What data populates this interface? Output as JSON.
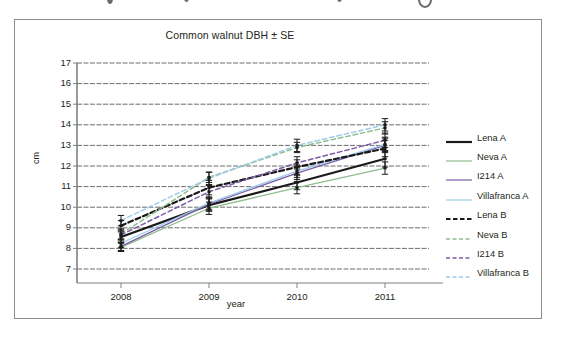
{
  "figure": {
    "title": "Common  walnut DBH ± SE",
    "border_color": "#8d8d8d",
    "background": "#ffffff"
  },
  "axes": {
    "x_title": "year",
    "y_title": "cm",
    "x_ticks": [
      "2008",
      "2009",
      "2010",
      "2011"
    ],
    "y_ticks": [
      "17",
      "16",
      "15",
      "14",
      "13",
      "12",
      "11",
      "10",
      "9",
      "8",
      "7"
    ],
    "gridline_color": "#555555",
    "axis_color": "#808080"
  },
  "legend": {
    "items": [
      {
        "label": "Lena A",
        "color": "#1a1a1a",
        "style": "solid",
        "width": 2.2
      },
      {
        "label": "Neva A",
        "color": "#8fbc8f",
        "style": "solid",
        "width": 1.2
      },
      {
        "label": "I214 A",
        "color": "#7b5ea7",
        "style": "solid",
        "width": 1.2
      },
      {
        "label": "Villafranca A",
        "color": "#9ecbe8",
        "style": "solid",
        "width": 1.2
      },
      {
        "label": "Lena B",
        "color": "#1a1a1a",
        "style": "dashed",
        "width": 2.2
      },
      {
        "label": "Neva B",
        "color": "#8fbc8f",
        "style": "dashed",
        "width": 1.4
      },
      {
        "label": "I214 B",
        "color": "#7b5ea7",
        "style": "dashed",
        "width": 1.4
      },
      {
        "label": "Villafranca B",
        "color": "#9ecbe8",
        "style": "dashed",
        "width": 1.4
      }
    ]
  },
  "chart_data": {
    "type": "line",
    "title": "Common  walnut DBH ± SE",
    "xlabel": "year",
    "ylabel": "cm",
    "x": [
      "2008",
      "2009",
      "2010",
      "2011"
    ],
    "ylim": [
      7,
      17
    ],
    "ytick_step": 1,
    "grid": true,
    "legend_position": "right",
    "error_bars": "SE",
    "series": [
      {
        "name": "Lena A",
        "color": "#1a1a1a",
        "style": "solid",
        "values": [
          8.55,
          10.1,
          11.2,
          12.35
        ],
        "errors": [
          0.25,
          0.3,
          0.35,
          0.4
        ]
      },
      {
        "name": "Neva A",
        "color": "#8fbc8f",
        "style": "solid",
        "values": [
          8.05,
          9.95,
          10.95,
          11.9
        ],
        "errors": [
          0.2,
          0.3,
          0.3,
          0.3
        ]
      },
      {
        "name": "I214 A",
        "color": "#7b5ea7",
        "style": "solid",
        "values": [
          8.1,
          10.15,
          11.65,
          13.0
        ],
        "errors": [
          0.2,
          0.3,
          0.3,
          0.35
        ]
      },
      {
        "name": "Villafranca A",
        "color": "#9ecbe8",
        "style": "solid",
        "values": [
          8.25,
          10.2,
          11.75,
          13.05
        ],
        "errors": [
          0.2,
          0.3,
          0.3,
          0.35
        ]
      },
      {
        "name": "Lena B",
        "color": "#1a1a1a",
        "style": "dashed",
        "values": [
          9.1,
          10.95,
          11.95,
          12.85
        ],
        "errors": [
          0.25,
          0.35,
          0.35,
          0.4
        ]
      },
      {
        "name": "Neva B",
        "color": "#8fbc8f",
        "style": "dashed",
        "values": [
          8.7,
          11.45,
          12.9,
          13.85
        ],
        "errors": [
          0.25,
          0.25,
          0.25,
          0.3
        ]
      },
      {
        "name": "I214 B",
        "color": "#7b5ea7",
        "style": "dashed",
        "values": [
          8.65,
          10.75,
          12.15,
          13.25
        ],
        "errors": [
          0.25,
          0.3,
          0.3,
          0.35
        ]
      },
      {
        "name": "Villafranca B",
        "color": "#9ecbe8",
        "style": "dashed",
        "values": [
          9.35,
          11.4,
          13.0,
          14.0
        ],
        "errors": [
          0.25,
          0.3,
          0.3,
          0.3
        ]
      }
    ]
  }
}
